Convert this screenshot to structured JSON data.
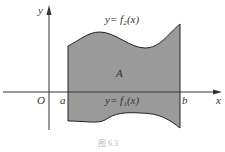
{
  "figure": {
    "caption": "图 6.3",
    "axes": {
      "x_label": "x",
      "y_label": "y",
      "origin_label": "O"
    },
    "bounds": {
      "a_label": "a",
      "b_label": "b"
    },
    "curves": {
      "upper": "y= f₂(x)",
      "lower": "y= f₁(x)"
    },
    "region_label": "A",
    "colors": {
      "fill": "#9a9a9a",
      "stroke": "#222222",
      "axis": "#333333"
    }
  }
}
